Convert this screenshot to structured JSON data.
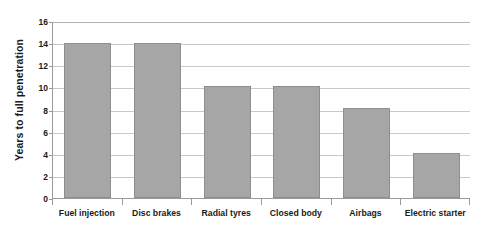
{
  "chart_data": {
    "type": "bar",
    "title": "",
    "subtitle": "",
    "xlabel": "",
    "ylabel": "Years to full penetration",
    "categories": [
      "Fuel injection",
      "Disc brakes",
      "Radial tyres",
      "Closed body",
      "Airbags",
      "Electric starter"
    ],
    "values": [
      14,
      14,
      10.1,
      10.1,
      8.1,
      4.1
    ],
    "ylim": [
      0,
      16
    ],
    "ytick_values": [
      0,
      2,
      4,
      6,
      8,
      10,
      12,
      14,
      16
    ],
    "ytick_labels": [
      "0",
      "2",
      "4",
      "6",
      "8",
      "10",
      "12",
      "14",
      "16"
    ],
    "grid": true,
    "grid_axis": "y",
    "legend": false,
    "legend_position": "none",
    "bar_color": "#a6a6a6",
    "bar_border_color": "#8e8e8e",
    "gridline_color": "#c9c9c9",
    "axis_color": "#9a9a9a",
    "text_color": "#1a1a1a",
    "background_color": "#ffffff"
  }
}
